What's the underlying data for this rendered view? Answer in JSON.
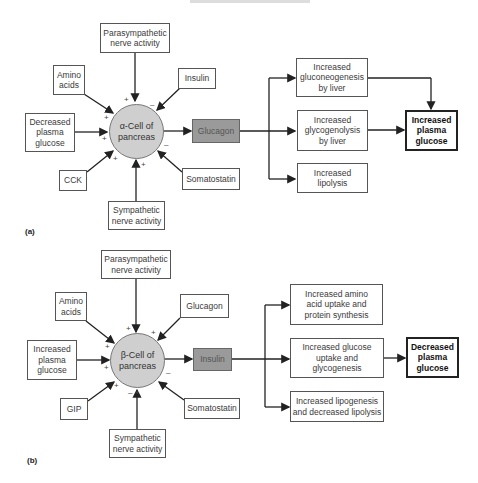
{
  "panels": [
    {
      "label": "(a)",
      "cell": "α-Cell of\npancreas",
      "hormone": "Glucagon",
      "inputs": {
        "top": {
          "text": "Parasympathetic\nnerve activity",
          "sign": "+"
        },
        "upper_left": {
          "text": "Amino\nacids",
          "sign": "+"
        },
        "upper_right": {
          "text": "Insulin",
          "sign": "–"
        },
        "left": {
          "text": "Decreased\nplasma\nglucose",
          "sign": "+"
        },
        "lower_left": {
          "text": "CCK",
          "sign": "+"
        },
        "lower_right": {
          "text": "Somatostatin",
          "sign": "–"
        },
        "bottom": {
          "text": "Sympathetic\nnerve activity",
          "sign": "+"
        }
      },
      "effects": [
        "Increased\ngluconeogenesis\nby liver",
        "Increased\nglycogenolysis\nby liver",
        "Increased\nlipolysis"
      ],
      "outcome": "Increased\nplasma\nglucose"
    },
    {
      "label": "(b)",
      "cell": "β-Cell of\npancreas",
      "hormone": "Insulin",
      "inputs": {
        "top": {
          "text": "Parasympathetic\nnerve activity",
          "sign": "+"
        },
        "upper_left": {
          "text": "Amino\nacids",
          "sign": "+"
        },
        "upper_right": {
          "text": "Glucagon",
          "sign": "+"
        },
        "left": {
          "text": "Increased\nplasma\nglucose",
          "sign": "+"
        },
        "lower_left": {
          "text": "GIP",
          "sign": "+"
        },
        "lower_right": {
          "text": "Somatostatin",
          "sign": "–"
        },
        "bottom": {
          "text": "Sympathetic\nnerve activity",
          "sign": "– +"
        }
      },
      "effects": [
        "Increased amino\nacid uptake and\nprotein synthesis",
        "Increased glucose\nuptake and\nglycogenesis",
        "Increased lipogenesis\nand decreased lipolysis"
      ],
      "outcome": "Decreased\nplasma\nglucose"
    }
  ],
  "colors": {
    "cell_fill": "#cfcfcf",
    "hormone_fill": "#9a9a9a",
    "line": "#222222"
  }
}
